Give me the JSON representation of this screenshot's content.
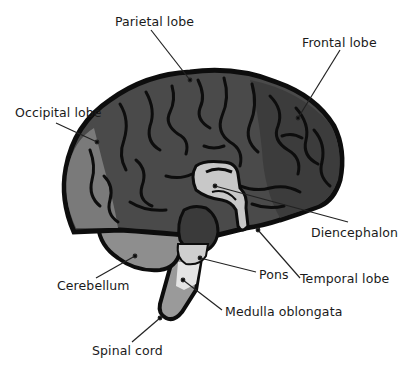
{
  "diagram": {
    "colors": {
      "outline": "#0d0d0d",
      "cerebrum": "#4a4a4a",
      "frontal_dark": "#3c3c3c",
      "occipital": "#7a7a7a",
      "cerebellum": "#8e8e8e",
      "diencephalon": "#c8c8c8",
      "pons": "#cfcfcf",
      "medulla": "#e4e4e4",
      "spinal_cord": "#9a9a9a",
      "midbrain": "#3a3a3a",
      "leader_line": "#222222",
      "label_text": "#1a1a1a"
    },
    "labels": [
      {
        "id": "parietal",
        "text": "Parietal lobe",
        "x": 115,
        "y": 15
      },
      {
        "id": "frontal",
        "text": "Frontal lobe",
        "x": 302,
        "y": 36
      },
      {
        "id": "occipital",
        "text": "Occipital lobe",
        "x": 15,
        "y": 106
      },
      {
        "id": "diencephalon",
        "text": "Diencephalon",
        "x": 311,
        "y": 226
      },
      {
        "id": "pons",
        "text": "Pons",
        "x": 259,
        "y": 268
      },
      {
        "id": "temporal",
        "text": "Temporal lobe",
        "x": 300,
        "y": 272
      },
      {
        "id": "cerebellum",
        "text": "Cerebellum",
        "x": 57,
        "y": 279
      },
      {
        "id": "medulla",
        "text": "Medulla oblongata",
        "x": 225,
        "y": 305
      },
      {
        "id": "spinal",
        "text": "Spinal cord",
        "x": 92,
        "y": 344
      }
    ]
  }
}
